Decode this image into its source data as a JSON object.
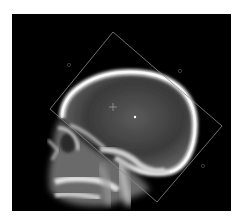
{
  "image": {
    "subject": "Lateral skull X-ray",
    "background_color": "#000000",
    "overlay_color": "#8a8a8a"
  },
  "overlay": {
    "shape": "rotated-square-roi",
    "corners": {
      "top": [
        113,
        32
      ],
      "right": [
        222,
        126
      ],
      "bottom": [
        157,
        202
      ],
      "left": [
        50,
        109
      ]
    },
    "handles": [
      {
        "name": "handle-top-left",
        "x": 69,
        "y": 65
      },
      {
        "name": "handle-top-right",
        "x": 180,
        "y": 71
      },
      {
        "name": "handle-bottom-right",
        "x": 203,
        "y": 166
      }
    ],
    "crosshair": {
      "x": 113,
      "y": 107
    },
    "center_point": {
      "x": 135,
      "y": 117
    }
  }
}
